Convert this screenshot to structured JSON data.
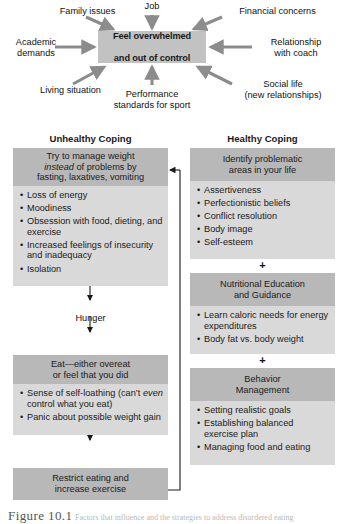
{
  "figure": {
    "caption_number": "Figure 10.1",
    "caption_text": "Factors that influence and the strategies to address disordered eating"
  },
  "stress_diagram": {
    "center_line1": "Feel overwhelmed",
    "center_line2": "and out of control",
    "stressors": [
      {
        "id": "family-issues",
        "label": "Family issues"
      },
      {
        "id": "job",
        "label": "Job"
      },
      {
        "id": "financial-concerns",
        "label": "Financial concerns"
      },
      {
        "id": "academic-demands",
        "label": "Academic\ndemands"
      },
      {
        "id": "relationship-coach",
        "label": "Relationship\nwith coach"
      },
      {
        "id": "living-situation",
        "label": "Living situation"
      },
      {
        "id": "performance",
        "label": "Performance\nstandards for sport"
      },
      {
        "id": "social-life",
        "label": "Social life\n(new relationships)"
      }
    ]
  },
  "columns": {
    "unhealthy": {
      "header": "Unhealthy Coping",
      "box1_line1": "Try to manage weight",
      "box1_line2_pre": "instead",
      "box1_line2_post": " of problems by",
      "box1_line3": "fasting, laxatives, vomiting",
      "list1": [
        "Loss of energy",
        "Moodiness",
        "Obsession with food, dieting, and exercise",
        "Increased feelings of insecurity and inadequacy",
        "Isolation"
      ],
      "hunger_label": "Hunger",
      "box2_line1": "Eat—either overeat",
      "box2_line2": "or feel that you did",
      "list2_item1_pre": "Sense of self-loathing (can’t ",
      "list2_item1_em": "even",
      "list2_item1_post": " control what you eat)",
      "list2_item2": "Panic about possible weight gain",
      "box3_line1": "Restrict eating and",
      "box3_line2": "increase exercise"
    },
    "healthy": {
      "header": "Healthy Coping",
      "box1_line1": "Identify problematic",
      "box1_line2": "areas in your life",
      "list1": [
        "Assertiveness",
        "Perfectionistic beliefs",
        "Conflict resolution",
        "Body image",
        "Self-esteem"
      ],
      "plus1": "+",
      "box2_line1": "Nutritional Education",
      "box2_line2": "and Guidance",
      "list2": [
        "Learn caloric needs for energy expenditures",
        "Body fat vs. body weight"
      ],
      "plus2": "+",
      "box3_line1": "Behavior",
      "box3_line2": "Management",
      "list3": [
        "Setting realistic goals",
        "Establishing balanced exercise plan",
        "Managing food and eating"
      ]
    }
  },
  "colors": {
    "box_header": "#b8b8b8",
    "box_body": "#d9d9d9",
    "center_box": "#c2c2c2",
    "arrow": "#8c8c8c",
    "line": "#1a1a1a"
  }
}
